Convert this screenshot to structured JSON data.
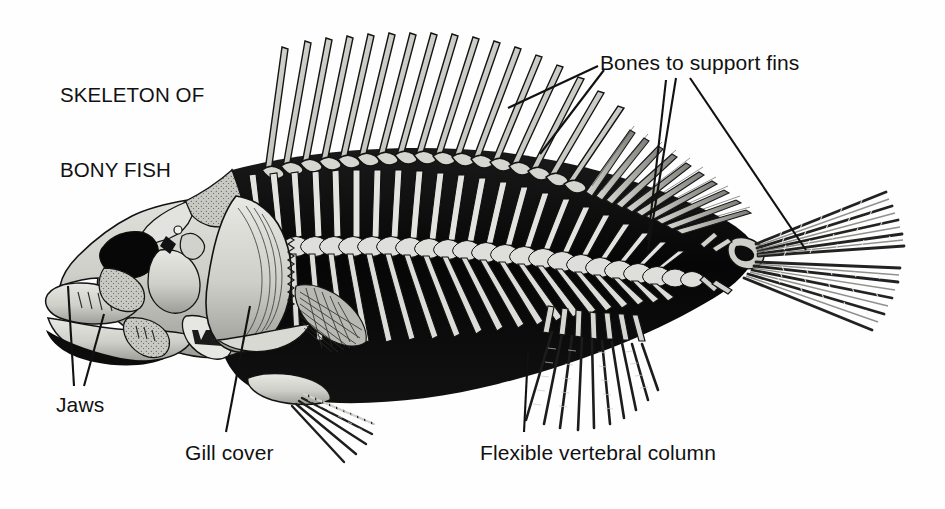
{
  "figure": {
    "title_line1": "SKELETON OF",
    "title_line2": "BONY FISH",
    "background_color": "#fefefe",
    "ink_color": "#111111",
    "bone_fill_color": "#c9c9c4",
    "body_shadow_color": "#0d0d0d"
  },
  "labels": {
    "bones_to_support_fins": "Bones to support fins",
    "jaws": "Jaws",
    "gill_cover": "Gill cover",
    "flexible_vertebral_column": "Flexible vertebral column"
  },
  "leader_lines": {
    "bones_to_support_fins_count": 4,
    "jaws_count": 2,
    "gill_cover_count": 1,
    "flexible_vertebral_column_count": 1
  },
  "anatomy": {
    "parts": [
      "skull",
      "upper jaw",
      "lower jaw",
      "gill cover (operculum)",
      "dorsal spines",
      "soft dorsal fin rays",
      "vertebral column",
      "ribs",
      "pectoral fin",
      "pelvic fin",
      "anal fin",
      "caudal fin"
    ],
    "dorsal_spine_count": 17,
    "vertebra_count": 24
  }
}
